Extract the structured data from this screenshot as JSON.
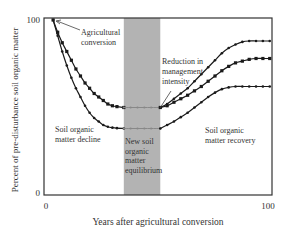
{
  "chart_data": {
    "type": "line",
    "title": "",
    "xlabel": "Years after agricultural conversion",
    "ylabel": "Percent of pre-disturbance soil organic matter",
    "xlim": [
      0,
      100
    ],
    "ylim": [
      0,
      100
    ],
    "x_ticks": [
      "0",
      "100"
    ],
    "y_ticks": [
      "0",
      "100"
    ],
    "grid": false,
    "legend": null,
    "shaded_region": {
      "x_start": 35,
      "x_end": 51,
      "label": "New soil organic matter equilibrium",
      "color": "#b3b3b3"
    },
    "series": [
      {
        "name": "Decline (moderate)",
        "x": [
          4,
          6,
          8,
          10,
          12,
          14,
          16,
          18,
          20,
          22,
          24,
          26,
          28,
          30,
          32,
          35
        ],
        "y": [
          100,
          93,
          87,
          82,
          77,
          72,
          68,
          64,
          61,
          58,
          56,
          54,
          52,
          51,
          50.5,
          50
        ]
      },
      {
        "name": "Decline (severe)",
        "x": [
          4,
          6,
          8,
          10,
          12,
          14,
          16,
          18,
          20,
          22,
          24,
          26,
          28,
          30,
          32,
          35
        ],
        "y": [
          100,
          91,
          82,
          74,
          67,
          61,
          56,
          51,
          47,
          44,
          42,
          40,
          39,
          38.5,
          38.2,
          38
        ]
      },
      {
        "name": "Equilibrium (upper)",
        "x": [
          35,
          38,
          41,
          44,
          47,
          51
        ],
        "y": [
          50,
          50,
          50,
          50,
          50,
          50
        ]
      },
      {
        "name": "Equilibrium (lower)",
        "x": [
          35,
          38,
          41,
          44,
          47,
          51
        ],
        "y": [
          38,
          38,
          38,
          38,
          38,
          38
        ]
      },
      {
        "name": "Recovery (high)",
        "x": [
          51,
          54,
          57,
          60,
          63,
          66,
          69,
          72,
          75,
          78,
          81,
          84,
          87,
          90,
          93,
          96,
          99
        ],
        "y": [
          50,
          52,
          55,
          58,
          61,
          65,
          69,
          73,
          77,
          81,
          84,
          86,
          87.5,
          88,
          88,
          88,
          88
        ]
      },
      {
        "name": "Recovery (medium)",
        "x": [
          51,
          54,
          57,
          60,
          63,
          66,
          69,
          72,
          75,
          78,
          81,
          84,
          87,
          90,
          93,
          96,
          99
        ],
        "y": [
          50,
          51,
          53,
          55,
          57,
          59.5,
          62,
          65,
          68,
          71,
          73.5,
          75.5,
          76.5,
          77.5,
          78,
          78,
          78
        ]
      },
      {
        "name": "Recovery (low)",
        "x": [
          51,
          54,
          57,
          60,
          63,
          66,
          69,
          72,
          75,
          78,
          81,
          84,
          87,
          90,
          93,
          96,
          99
        ],
        "y": [
          38,
          40,
          42,
          44.5,
          47,
          50,
          53,
          56,
          58.5,
          60.5,
          61.5,
          62,
          62,
          62,
          62,
          62,
          62
        ]
      }
    ],
    "annotations": [
      {
        "text": "Agricultural conversion",
        "x": 18,
        "y": 92
      },
      {
        "text": "Reduction in management intensity",
        "x": 58,
        "y": 70
      },
      {
        "text": "Soil organic matter decline",
        "x": 6,
        "y": 33
      },
      {
        "text": "New soil organic matter equilibrium",
        "x": 36,
        "y": 32
      },
      {
        "text": "Soil organic matter recovery",
        "x": 68,
        "y": 33
      }
    ]
  },
  "labels": {
    "ylabel": "Percent of pre-disturbance soil organic matter",
    "xlabel": "Years after agricultural conversion",
    "y_top": "100",
    "y_bottom": "0",
    "x_left": "0",
    "x_right": "100",
    "ann_conversion_1": "Agricultural",
    "ann_conversion_2": "conversion",
    "ann_reduction_1": "Reduction in",
    "ann_reduction_2": "management",
    "ann_reduction_3": "intensity",
    "ann_decline_1": "Soil organic",
    "ann_decline_2": "matter decline",
    "ann_equil_1": "New soil",
    "ann_equil_2": "organic",
    "ann_equil_3": "matter",
    "ann_equil_4": "equilibrium",
    "ann_recovery_1": "Soil organic",
    "ann_recovery_2": "matter recovery"
  },
  "colors": {
    "band": "#b3b3b3",
    "line": "#1a1a1a",
    "equilibrium_line": "#888888",
    "frame": "#333333"
  }
}
